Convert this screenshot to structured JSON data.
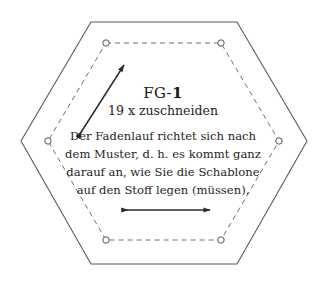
{
  "sheet": {
    "background_color": "#ffffff",
    "outline_color": "#5a5a5a",
    "seam_line_color": "#6e6e6e",
    "text_color": "#1d1d1d",
    "arrow_color": "#2b2b2b"
  },
  "pattern_piece": {
    "title_prefix": "FG-",
    "title_number": "1",
    "title_full": "FG-1",
    "cut_count": "19 x zuschneiden",
    "grain_note_lines": [
      "Der Fadenlauf richtet sich nach",
      "dem Muster, d. h. es kommt ganz",
      "darauf an, wie Sie die Schablone",
      "auf den Stoff legen (müssen)."
    ]
  },
  "geometry": {
    "cut_line_label": "cutting-line-hexagon",
    "seam_line_label": "seam-line-hexagon",
    "cut_hexagon_points": "91,22 237,22 307,141 237,264 91,264 21,141",
    "seam_hexagon_points": "106,43 221,43 279,141 221,240 106,240 48,141",
    "seam_dash_pattern": "5 4",
    "corner_markers": [
      {
        "name": "corner-marker-top-left",
        "cx": 106,
        "cy": 43,
        "r": 3.2
      },
      {
        "name": "corner-marker-top-right",
        "cx": 221,
        "cy": 43,
        "r": 3.2
      },
      {
        "name": "corner-marker-right",
        "cx": 279,
        "cy": 141,
        "r": 3.2
      },
      {
        "name": "corner-marker-bottom-right",
        "cx": 221,
        "cy": 240,
        "r": 3.2
      },
      {
        "name": "corner-marker-bottom-left",
        "cx": 106,
        "cy": 240,
        "r": 3.2
      },
      {
        "name": "corner-marker-left",
        "cx": 48,
        "cy": 141,
        "r": 3.2
      }
    ],
    "grain_arrow_diagonal": {
      "x1": 78,
      "y1": 137,
      "x2": 124,
      "y2": 65
    },
    "grain_arrow_horizontal": {
      "x1": 122,
      "y1": 210,
      "x2": 210,
      "y2": 210
    }
  }
}
